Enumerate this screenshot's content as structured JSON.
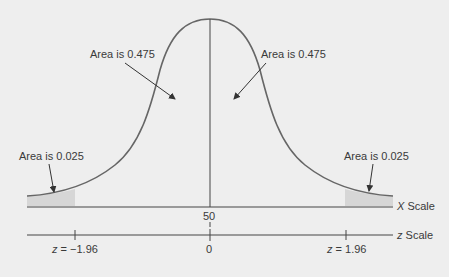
{
  "diagram": {
    "type": "normal-distribution",
    "center_area_left": "Area is 0.475",
    "center_area_right": "Area is 0.475",
    "tail_area_left": "Area is 0.025",
    "tail_area_right": "Area is 0.025",
    "x_scale": {
      "label_var": "X",
      "label_text": "Scale",
      "center_value": "50"
    },
    "z_scale": {
      "label_var": "z",
      "label_text": "Scale",
      "center_value": "0",
      "left_tick": {
        "var": "z",
        "eq": "=",
        "value": "−1.96"
      },
      "right_tick": {
        "var": "z",
        "eq": "=",
        "value": "1.96"
      }
    },
    "colors": {
      "curve": "#666666",
      "shade": "#d4d4d4",
      "axis": "#444444",
      "background": "#eeeeee"
    }
  }
}
